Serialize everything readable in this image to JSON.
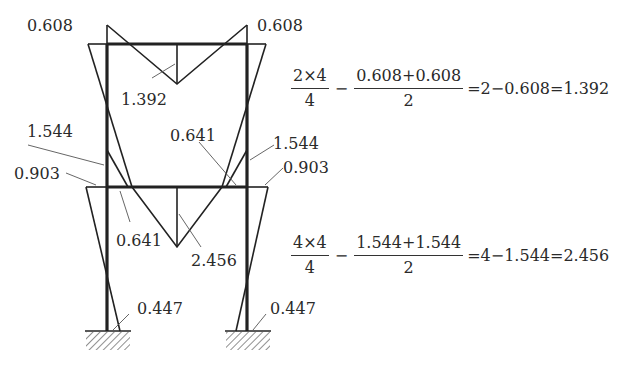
{
  "diagram": {
    "type": "bending-moment-diagram-two-story-frame",
    "labels": {
      "top_left_corner": "0.608",
      "top_right_corner": "0.608",
      "top_beam_mid": "1.392",
      "upper_left_col_bottom": "1.544",
      "upper_right_col_bottom": "1.544",
      "lower_left_col_top": "0.903",
      "lower_right_col_top": "0.903",
      "mid_beam_right_end": "0.641",
      "mid_beam_left_end": "0.641",
      "mid_beam_mid": "2.456",
      "left_base": "0.447",
      "right_base": "0.447"
    }
  },
  "equations": {
    "eq1": {
      "frac1_num": "2×4",
      "frac1_den": "4",
      "minus": "−",
      "frac2_num": "0.608+0.608",
      "frac2_den": "2",
      "rest": "=2−0.608=1.392"
    },
    "eq2": {
      "frac1_num": "4×4",
      "frac1_den": "4",
      "minus": "−",
      "frac2_num": "1.544+1.544",
      "frac2_den": "2",
      "rest": "=4−1.544=2.456"
    }
  }
}
